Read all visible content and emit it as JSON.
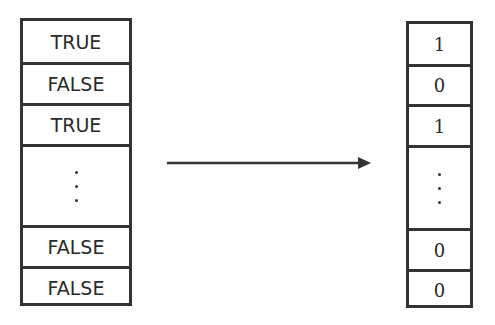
{
  "diagram": {
    "left_column": {
      "cells": [
        "TRUE",
        "FALSE",
        "TRUE",
        "⋮",
        "FALSE",
        "FALSE"
      ]
    },
    "right_column": {
      "cells": [
        "1",
        "0",
        "1",
        "⋮",
        "0",
        "0"
      ]
    },
    "arrow": {
      "direction": "right",
      "from": "left_column",
      "to": "right_column"
    },
    "colors": {
      "stroke": "#333333",
      "background": "#ffffff",
      "text": "#2a2a2a"
    }
  }
}
